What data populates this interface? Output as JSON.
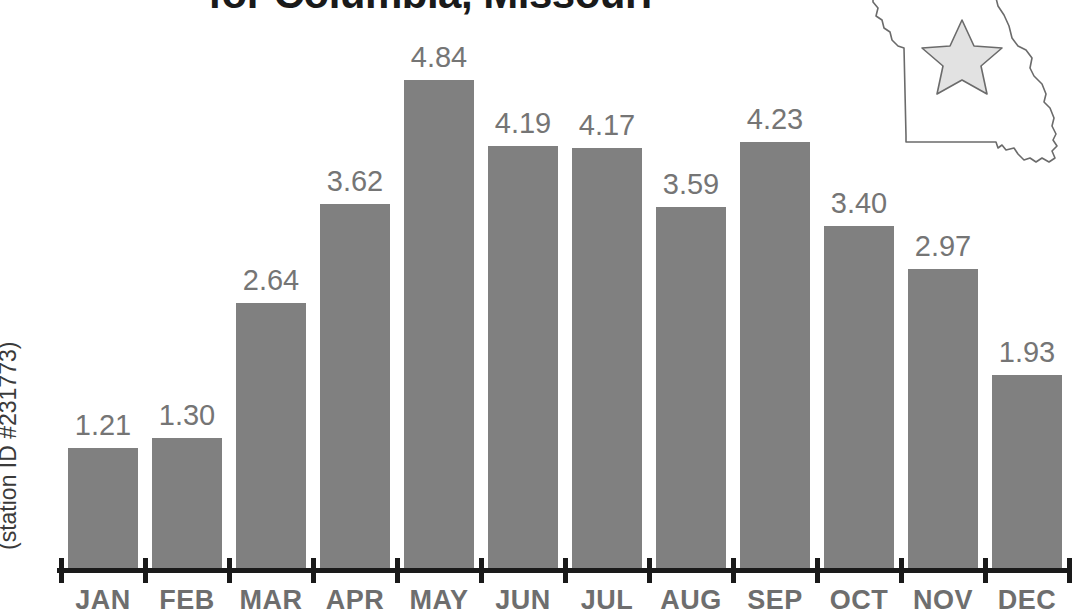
{
  "title": "for Columbia, Missouri",
  "y_axis_caption": "(station ID #231773)",
  "colors": {
    "bar": "#808080",
    "value_label": "#757575",
    "month_label": "#6e6e6e",
    "axis": "#1a1a1a",
    "title": "#1a1a1a",
    "map_outline": "#6b6b6b",
    "star_fill": "#e2e2e2",
    "star_outline": "#6b6b6b"
  },
  "map": {
    "state_name": "Missouri",
    "marker_label": "Columbia"
  },
  "chart_data": {
    "type": "bar",
    "title": "for Columbia, Missouri",
    "subtitle": "(station ID #231773)",
    "xlabel": "",
    "ylabel": "",
    "ylim": [
      0,
      5.3
    ],
    "grid": false,
    "legend": "none",
    "categories": [
      "JAN",
      "FEB",
      "MAR",
      "APR",
      "MAY",
      "JUN",
      "JUL",
      "AUG",
      "SEP",
      "OCT",
      "NOV",
      "DEC"
    ],
    "values": [
      1.21,
      1.3,
      2.64,
      3.62,
      4.84,
      4.19,
      4.17,
      3.59,
      4.23,
      3.4,
      2.97,
      1.93
    ],
    "value_labels": [
      "1.21",
      "1.30",
      "2.64",
      "3.62",
      "4.84",
      "4.19",
      "4.17",
      "3.59",
      "4.23",
      "3.40",
      "2.97",
      "1.93"
    ]
  }
}
